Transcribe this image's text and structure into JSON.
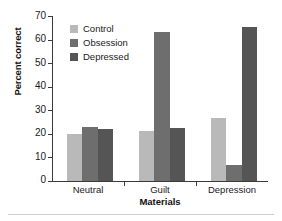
{
  "chart_data": {
    "type": "bar",
    "title": "",
    "xlabel": "Materials",
    "ylabel": "Percent correct",
    "categories": [
      "Neutral",
      "Guilt",
      "Depression"
    ],
    "ylim": [
      0,
      70
    ],
    "yticks": [
      0,
      10,
      20,
      30,
      40,
      50,
      60,
      70
    ],
    "ytick_labels": [
      "0",
      "10",
      "20",
      "30",
      "40",
      "50",
      "60",
      "70"
    ],
    "grid": false,
    "legend_position": "upper-left-inside",
    "series": [
      {
        "name": "Control",
        "color": "#b9b9b9",
        "values": [
          20,
          21,
          26.5
        ]
      },
      {
        "name": "Obsession",
        "color": "#6e6e6e",
        "values": [
          23,
          63,
          6.5
        ]
      },
      {
        "name": "Depressed",
        "color": "#555555",
        "values": [
          22,
          22.5,
          65.5
        ]
      }
    ]
  },
  "legend": {
    "items": [
      {
        "label": "Control"
      },
      {
        "label": "Obsession"
      },
      {
        "label": "Depressed"
      }
    ]
  },
  "axes": {
    "y_title": "Percent correct",
    "x_title": "Materials",
    "y_tick_labels": [
      "70",
      "60",
      "50",
      "40",
      "30",
      "20",
      "10",
      "0"
    ],
    "x_tick_labels": [
      "Neutral",
      "Guilt",
      "Depression"
    ]
  }
}
